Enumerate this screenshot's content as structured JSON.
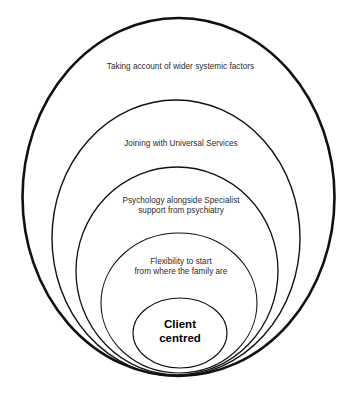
{
  "diagram": {
    "background_color": "#ffffff",
    "stroke_color": "#111111",
    "text_color": "#2b2b2b",
    "core_text_color": "#000000",
    "rings": [
      {
        "id": "ring-1",
        "level": 1,
        "label": "Taking account of wider systemic factors",
        "cx": 178.5,
        "cy": 197,
        "rx": 156,
        "ry": 179,
        "stroke_width": 2.6
      },
      {
        "id": "ring-2",
        "level": 2,
        "label": "Joining with Universal Services",
        "cx": 176,
        "cy": 238,
        "rx": 124,
        "ry": 138,
        "stroke_width": 1.4
      },
      {
        "id": "ring-3",
        "level": 3,
        "label": "Psychology alongside Specialist\nsupport from psychiatry",
        "cx": 177,
        "cy": 271,
        "rx": 101,
        "ry": 104,
        "stroke_width": 1.3
      },
      {
        "id": "ring-4",
        "level": 4,
        "label": "Flexibility to start\nfrom where the family are",
        "cx": 179,
        "cy": 303,
        "rx": 78,
        "ry": 70,
        "stroke_width": 1.1
      },
      {
        "id": "ring-5",
        "level": 5,
        "label": "Client\ncentred",
        "cx": 180,
        "cy": 333,
        "rx": 47,
        "ry": 35,
        "stroke_width": 1.1
      }
    ]
  }
}
